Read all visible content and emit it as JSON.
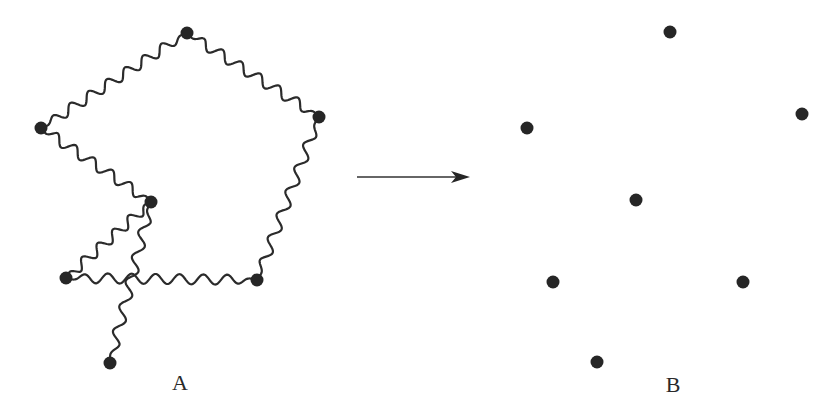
{
  "diagram": {
    "colors": {
      "background": "#ffffff",
      "ink": "#262626",
      "spring": "#2b2b2b"
    },
    "panel_a": {
      "label": "A",
      "label_pos": [
        180,
        383
      ],
      "node_radius": 6.5,
      "nodes": [
        {
          "id": "a1",
          "x": 187,
          "y": 33
        },
        {
          "id": "a2",
          "x": 319,
          "y": 117
        },
        {
          "id": "a3",
          "x": 41,
          "y": 128
        },
        {
          "id": "a4",
          "x": 151,
          "y": 202
        },
        {
          "id": "a5",
          "x": 66,
          "y": 278
        },
        {
          "id": "a6",
          "x": 257,
          "y": 280
        },
        {
          "id": "a7",
          "x": 110,
          "y": 363
        }
      ],
      "springs": [
        {
          "from": "a3",
          "to": "a1",
          "waves": 8
        },
        {
          "from": "a1",
          "to": "a2",
          "waves": 7
        },
        {
          "from": "a2",
          "to": "a6",
          "waves": 7
        },
        {
          "from": "a6",
          "to": "a5",
          "waves": 8
        },
        {
          "from": "a3",
          "to": "a4",
          "waves": 6
        },
        {
          "from": "a4",
          "to": "a5",
          "waves": 5.5
        },
        {
          "from": "a4",
          "to": "a7",
          "waves": 6.5
        }
      ],
      "spring_amplitude": 5
    },
    "arrow": {
      "x1": 357,
      "y1": 177,
      "x2": 470,
      "y2": 177
    },
    "panel_b": {
      "label": "B",
      "label_pos": [
        673,
        385
      ],
      "node_radius": 6.5,
      "nodes": [
        {
          "id": "b1",
          "x": 670,
          "y": 32
        },
        {
          "id": "b2",
          "x": 802,
          "y": 114
        },
        {
          "id": "b3",
          "x": 527,
          "y": 128
        },
        {
          "id": "b4",
          "x": 636,
          "y": 200
        },
        {
          "id": "b5",
          "x": 553,
          "y": 282
        },
        {
          "id": "b6",
          "x": 743,
          "y": 282
        },
        {
          "id": "b7",
          "x": 597,
          "y": 362
        }
      ]
    }
  }
}
